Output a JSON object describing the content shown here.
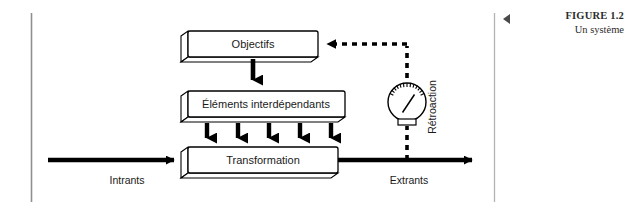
{
  "figure": {
    "caption_title": "FIGURE 1.2",
    "caption_subtitle": "Un système",
    "marker_icon": "left-triangle-icon"
  },
  "diagram": {
    "type": "system-flow-diagram",
    "boxes": [
      {
        "id": "objectifs",
        "label": "Objectifs"
      },
      {
        "id": "elements",
        "label": "Éléments interdépendants"
      },
      {
        "id": "transformation",
        "label": "Transformation"
      }
    ],
    "flow_labels": {
      "input": "Intrants",
      "output": "Extrants"
    },
    "feedback": {
      "label": "Rétroaction",
      "gauge_icon": "gauge-meter-icon",
      "line_style": "dashed"
    },
    "arrows": {
      "objectifs_to_elements": 1,
      "elements_to_transformation": 5
    },
    "colors": {
      "stroke": "#000000",
      "box_fill": "#ffffff",
      "box_side_fill": "#ffffff",
      "rule": "#9a9a9a",
      "text": "#1a1a1a"
    }
  }
}
